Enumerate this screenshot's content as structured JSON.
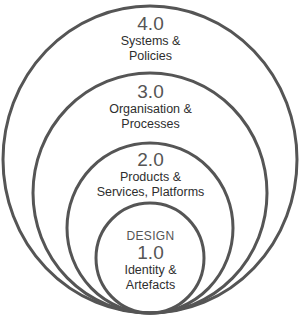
{
  "diagram": {
    "type": "nested-circles",
    "stroke_color": "#555555",
    "levels": [
      {
        "number": "4.0",
        "lines": [
          "Systems &",
          "Policies"
        ]
      },
      {
        "number": "3.0",
        "lines": [
          "Organisation &",
          "Processes"
        ]
      },
      {
        "number": "2.0",
        "lines": [
          "Products &",
          "Services, Platforms"
        ]
      },
      {
        "prefix": "DESIGN",
        "number": "1.0",
        "lines": [
          "Identity &",
          "Artefacts"
        ]
      }
    ]
  }
}
